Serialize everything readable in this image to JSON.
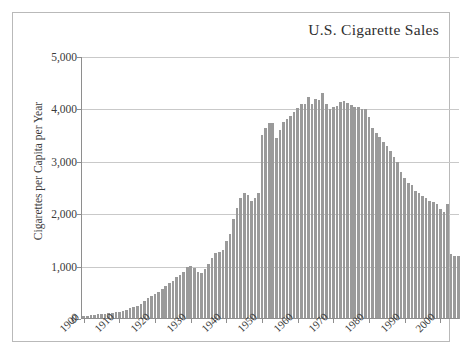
{
  "chart": {
    "title": "U.S. Cigarette Sales",
    "ylabel": "Cigarettes per Capita per Year",
    "xlabel": ""
  },
  "axes": {
    "y_ticks": [
      "0",
      "1,000",
      "2,000",
      "3,000",
      "4,000",
      "5,000"
    ],
    "x_ticks": [
      "1900",
      "1910",
      "1920",
      "1930",
      "1940",
      "1950",
      "1960",
      "1970",
      "1980",
      "1990",
      "2000"
    ]
  },
  "style": {
    "bar_color": "#9a9a9a",
    "grid_color": "#c9c9c9",
    "axis_color": "#8e8e8e",
    "frame_color": "#b9b9b9",
    "text_color": "#3a3a3a",
    "background": "#ffffff"
  },
  "chart_data": {
    "type": "bar",
    "title": "U.S. Cigarette Sales",
    "xlabel": "",
    "ylabel": "Cigarettes per Capita per Year",
    "ylim": [
      0,
      5000
    ],
    "xlim": [
      1900,
      2006
    ],
    "grid": true,
    "legend": "none",
    "y_ticks": [
      0,
      1000,
      2000,
      3000,
      4000,
      5000
    ],
    "x_ticks": [
      1900,
      1910,
      1920,
      1930,
      1940,
      1950,
      1960,
      1970,
      1980,
      1990,
      2000
    ],
    "categories": [
      1900,
      1901,
      1902,
      1903,
      1904,
      1905,
      1906,
      1907,
      1908,
      1909,
      1910,
      1911,
      1912,
      1913,
      1914,
      1915,
      1916,
      1917,
      1918,
      1919,
      1920,
      1921,
      1922,
      1923,
      1924,
      1925,
      1926,
      1927,
      1928,
      1929,
      1930,
      1931,
      1932,
      1933,
      1934,
      1935,
      1936,
      1937,
      1938,
      1939,
      1940,
      1941,
      1942,
      1943,
      1944,
      1945,
      1946,
      1947,
      1948,
      1949,
      1950,
      1951,
      1952,
      1953,
      1954,
      1955,
      1956,
      1957,
      1958,
      1959,
      1960,
      1961,
      1962,
      1963,
      1964,
      1965,
      1966,
      1967,
      1968,
      1969,
      1970,
      1971,
      1972,
      1973,
      1974,
      1975,
      1976,
      1977,
      1978,
      1979,
      1980,
      1981,
      1982,
      1983,
      1984,
      1985,
      1986,
      1987,
      1988,
      1989,
      1990,
      1991,
      1992,
      1993,
      1994,
      1995,
      1996,
      1997,
      1998,
      1999,
      2000,
      2001,
      2002,
      2003,
      2004,
      2005
    ],
    "values": [
      54,
      60,
      70,
      78,
      86,
      92,
      100,
      108,
      114,
      120,
      138,
      155,
      175,
      200,
      225,
      250,
      280,
      340,
      400,
      430,
      480,
      520,
      560,
      620,
      680,
      730,
      790,
      840,
      900,
      980,
      1000,
      960,
      900,
      880,
      950,
      1050,
      1150,
      1250,
      1270,
      1320,
      1480,
      1620,
      1900,
      2100,
      2300,
      2400,
      2350,
      2250,
      2300,
      2400,
      2530,
      2600,
      2650,
      2650,
      2450,
      2550,
      2660,
      2700,
      2740,
      2800,
      2850,
      2900,
      2900,
      3000,
      2900,
      2950,
      2900,
      2800,
      2700,
      2650,
      2600,
      2600,
      2650,
      2700,
      2700,
      2700,
      2650,
      2650,
      2600,
      2600,
      2550,
      2400,
      2350,
      2300,
      2250,
      2200,
      2150,
      2050,
      2000,
      1900,
      1800,
      1700,
      1650,
      1600,
      1550,
      1500,
      1450,
      1400,
      1380,
      1350,
      1250,
      1200,
      2200,
      1300,
      1200,
      1200
    ],
    "note_peak": {
      "year": 1963,
      "value": 3000
    },
    "pixel_profile_values": [
      55,
      60,
      70,
      80,
      90,
      95,
      105,
      110,
      118,
      125,
      140,
      158,
      178,
      205,
      230,
      255,
      285,
      345,
      405,
      435,
      485,
      525,
      565,
      625,
      685,
      735,
      795,
      845,
      905,
      985,
      1005,
      965,
      905,
      885,
      955,
      1055,
      1155,
      1255,
      1275,
      1325,
      1490,
      1630,
      1910,
      2110,
      2310,
      2410,
      2360,
      2260,
      2310,
      2410,
      3520,
      3640,
      3744,
      3744,
      3456,
      3600,
      3754,
      3811,
      3869,
      3955,
      4024,
      4094,
      4094,
      4235,
      4094,
      4200,
      4180,
      4320,
      4100,
      4000,
      4050,
      4060,
      4140,
      4160,
      4130,
      4090,
      4040,
      4050,
      4010,
      4000,
      3850,
      3650,
      3550,
      3480,
      3380,
      3300,
      3200,
      3100,
      3000,
      2800,
      2700,
      2600,
      2550,
      2450,
      2400,
      2350,
      2300,
      2250,
      2230,
      2190,
      2100,
      2050,
      2200,
      1250,
      1200,
      1200
    ]
  }
}
